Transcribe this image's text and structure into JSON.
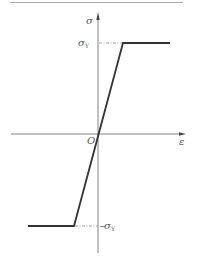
{
  "diagram": {
    "type": "stress-strain elastic-perfectly-plastic",
    "labels": {
      "y_axis": "σ",
      "x_axis": "ε",
      "origin": "O",
      "yield_top_main": "σ",
      "yield_top_sub": "Y",
      "yield_bottom_prefix": "−",
      "yield_bottom_main": "σ",
      "yield_bottom_sub": "Y"
    },
    "colors": {
      "axis": "#777777",
      "curve": "#333333",
      "dash": "#888888",
      "rule": "#aaaaaa"
    }
  }
}
